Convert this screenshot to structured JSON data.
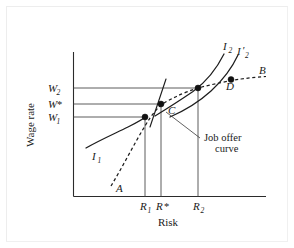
{
  "figure": {
    "kind": "indifference-curve-diagram",
    "background_color": "#ffffff",
    "ink_color": "#1a1a1a",
    "frame_color": "#ededed"
  },
  "axes": {
    "y_title": "Wage rate",
    "x_title": "Risk",
    "y_ticks": [
      {
        "key": "W2",
        "base": "W",
        "sub": "2",
        "sup": "",
        "y_px": 88
      },
      {
        "key": "Wstar",
        "base": "W",
        "sub": "",
        "sup": "*",
        "y_px": 104
      },
      {
        "key": "W1",
        "base": "W",
        "sub": "1",
        "sup": "",
        "y_px": 117
      }
    ],
    "x_ticks": [
      {
        "key": "R1",
        "base": "R",
        "sub": "1",
        "sup": "",
        "x_px": 145
      },
      {
        "key": "Rstar",
        "base": "R",
        "sub": "",
        "sup": "*",
        "x_px": 161
      },
      {
        "key": "R2",
        "base": "R",
        "sub": "2",
        "sup": "",
        "x_px": 198
      }
    ]
  },
  "curves": [
    {
      "name": "indifference-curve-I1",
      "label_base": "I",
      "label_sub": "1",
      "style": "solid",
      "description": "lower indifference curve through point at (R1, W1)"
    },
    {
      "name": "indifference-curve-I2",
      "label_base": "I",
      "label_sub": "2",
      "label_prime": "",
      "style": "solid",
      "description": "upper indifference curve through point at (R2, W2)"
    },
    {
      "name": "indifference-curve-I2-prime",
      "label_base": "I",
      "label_sub": "2",
      "label_prime": "′",
      "style": "solid",
      "description": "shifted upper indifference curve through point D"
    },
    {
      "name": "job-offer-curve",
      "style": "dashed",
      "description": "dashed market job offer curve from A through B"
    }
  ],
  "points": [
    {
      "name": "point-A",
      "label": "A",
      "role": "lower end of job offer curve"
    },
    {
      "name": "point-B",
      "label": "B",
      "role": "upper end of job offer curve"
    },
    {
      "name": "point-C",
      "label": "C",
      "role": "tangency at (R*, W*)"
    },
    {
      "name": "point-D",
      "label": "D",
      "role": "point on shifted curve"
    }
  ],
  "annotations": [
    {
      "name": "job-offer-curve-callout",
      "line1": "Job offer",
      "line2": "curve"
    }
  ]
}
